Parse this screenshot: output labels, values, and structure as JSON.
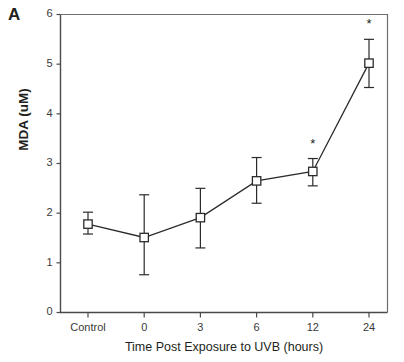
{
  "figure": {
    "panel_letter": "A"
  },
  "chart_data": {
    "type": "line",
    "title": "",
    "xlabel": "Time Post Exposure to UVB (hours)",
    "ylabel": "MDA (uM)",
    "categories": [
      "Control",
      "0",
      "3",
      "6",
      "12",
      "24"
    ],
    "values": [
      1.78,
      1.51,
      1.91,
      2.65,
      2.84,
      5.02
    ],
    "error_upper": [
      2.02,
      2.37,
      2.5,
      3.12,
      3.1,
      5.5
    ],
    "error_lower": [
      1.58,
      0.76,
      1.3,
      2.2,
      2.55,
      4.53
    ],
    "significance_markers": [
      {
        "category": "12",
        "symbol": "*"
      },
      {
        "category": "24",
        "symbol": "*"
      }
    ],
    "ylim": [
      0,
      6
    ],
    "yticks": [
      0,
      1,
      2,
      3,
      4,
      5,
      6
    ],
    "ytick_labels": [
      "0",
      "1",
      "2",
      "3",
      "4",
      "5",
      "6"
    ],
    "xtick_labels": [
      "Control",
      "0",
      "3",
      "6",
      "12",
      "24"
    ],
    "grid": false,
    "legend": "none",
    "marker_style": "open-square",
    "line_color": "#2b2b2b",
    "marker_fill": "#ffffff",
    "axis_color": "#4a4a4a"
  }
}
